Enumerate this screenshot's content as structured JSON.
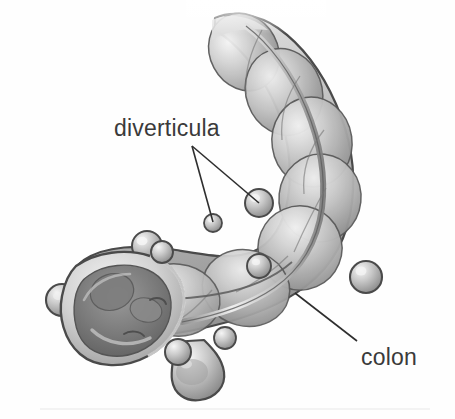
{
  "figure": {
    "style": "grayscale medical line drawing",
    "background_color": "#fefefe",
    "outline_color": "#4a4a4a",
    "tissue_mid_tone": "#b5b5b5",
    "tissue_highlight": "#f2f2f2",
    "tissue_shadow": "#8a8a8a",
    "lumen_dark": "#6f6f6f",
    "label_color": "#3a3a3a",
    "leader_line_color": "#2e2e2e"
  },
  "labels": {
    "diverticula": "diverticula",
    "colon": "colon"
  },
  "annotations": [
    {
      "name": "diverticula",
      "label": "diverticula",
      "text_x": 114,
      "text_y": 117,
      "leader_origin": {
        "x": 192,
        "y": 146
      },
      "leader_targets": [
        {
          "x": 213,
          "y": 222
        },
        {
          "x": 259,
          "y": 203
        }
      ]
    },
    {
      "name": "colon",
      "label": "colon",
      "text_x": 361,
      "text_y": 346,
      "leader_origin": {
        "x": 357,
        "y": 341
      },
      "leader_targets": [
        {
          "x": 295,
          "y": 293
        }
      ]
    }
  ],
  "anatomy": {
    "haustra_count": 7,
    "diverticula_pouches": [
      {
        "name": "pouch-upper-mid",
        "cx": 259,
        "cy": 203,
        "r": 13
      },
      {
        "name": "pouch-left-of-upper",
        "cx": 213,
        "cy": 223,
        "r": 9
      },
      {
        "name": "pouch-mid-body",
        "cx": 259,
        "cy": 266,
        "r": 11
      },
      {
        "name": "pouch-right-flank",
        "cx": 366,
        "cy": 277,
        "r": 14
      },
      {
        "name": "pouch-left-end",
        "cx": 62,
        "cy": 300,
        "r": 15
      },
      {
        "name": "pouch-bottom-large",
        "cx": 190,
        "cy": 378,
        "r": 22
      },
      {
        "name": "pouch-lower-left",
        "cx": 147,
        "cy": 246,
        "r": 14
      },
      {
        "name": "pouch-underside",
        "cx": 225,
        "cy": 338,
        "r": 10
      }
    ],
    "taenia_coli": "longitudinal stripe running along colon wall",
    "cut_section": "open lumen at distal end showing interior diverticular openings"
  }
}
